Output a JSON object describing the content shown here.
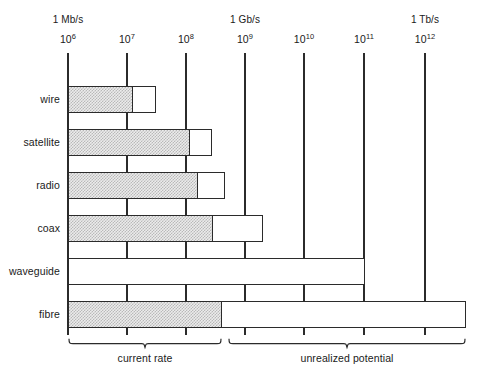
{
  "chart_data": {
    "type": "bar",
    "title": "",
    "subtitle": "",
    "xlabel": "",
    "ylabel": "",
    "orientation": "horizontal",
    "xscale": "log",
    "xlim": [
      1000000,
      3162277660168
    ],
    "grid": true,
    "legend_position": "none",
    "axis_ticks": [
      {
        "exponent_base": "10",
        "exponent": "6",
        "unit_label": "1 Mb/s",
        "value": 1000000
      },
      {
        "exponent_base": "10",
        "exponent": "7",
        "unit_label": "",
        "value": 10000000
      },
      {
        "exponent_base": "10",
        "exponent": "8",
        "unit_label": "",
        "value": 100000000
      },
      {
        "exponent_base": "10",
        "exponent": "9",
        "unit_label": "1 Gb/s",
        "value": 1000000000
      },
      {
        "exponent_base": "10",
        "exponent": "10",
        "unit_label": "",
        "value": 10000000000
      },
      {
        "exponent_base": "10",
        "exponent": "11",
        "unit_label": "",
        "value": 100000000000
      },
      {
        "exponent_base": "10",
        "exponent": "12",
        "unit_label": "1 Tb/s",
        "value": 1000000000000
      }
    ],
    "categories": [
      "wire",
      "satellite",
      "radio",
      "coax",
      "waveguide",
      "fibre"
    ],
    "series": [
      {
        "name": "current rate",
        "style": "shaded",
        "values": [
          11000000.0,
          120000000.0,
          170000000.0,
          340000000.0,
          1000000.0,
          850000000.0
        ]
      },
      {
        "name": "unrealized potential",
        "style": "open",
        "values": [
          32000000.0,
          290000000.0,
          500000000.0,
          2300000000.0,
          90000000000.0,
          7000000000000.0
        ]
      }
    ],
    "annotations": [
      {
        "text": "current rate",
        "span_start": 1000000,
        "span_end": 850000000
      },
      {
        "text": "unrealized potential",
        "span_start": 1000000000,
        "span_end": 7000000000000
      }
    ]
  },
  "chart": {
    "rows": [
      {
        "label": "wire",
        "fill_end_px": 133,
        "open_end_px": 156
      },
      {
        "label": "satellite",
        "fill_end_px": 190,
        "open_end_px": 212
      },
      {
        "label": "radio",
        "fill_end_px": 198,
        "open_end_px": 225
      },
      {
        "label": "coax",
        "fill_end_px": 213,
        "open_end_px": 263
      },
      {
        "label": "waveguide",
        "fill_end_px": 68,
        "open_end_px": 365
      },
      {
        "label": "fibre",
        "fill_end_px": 222,
        "open_end_px": 466
      }
    ],
    "ticks": [
      {
        "unit": "1 Mb/s",
        "mantissa": "10",
        "exp": "6",
        "x": 68
      },
      {
        "unit": "",
        "mantissa": "10",
        "exp": "7",
        "x": 127
      },
      {
        "unit": "",
        "mantissa": "10",
        "exp": "8",
        "x": 186
      },
      {
        "unit": "1 Gb/s",
        "mantissa": "10",
        "exp": "9",
        "x": 245
      },
      {
        "unit": "",
        "mantissa": "10",
        "exp": "10",
        "x": 304
      },
      {
        "unit": "",
        "mantissa": "10",
        "exp": "11",
        "x": 364
      },
      {
        "unit": "1 Tb/s",
        "mantissa": "10",
        "exp": "12",
        "x": 425
      }
    ],
    "braces": [
      {
        "label": "current rate",
        "start_px": 68,
        "end_px": 222
      },
      {
        "label": "unrealized potential",
        "start_px": 228,
        "end_px": 466
      }
    ]
  }
}
